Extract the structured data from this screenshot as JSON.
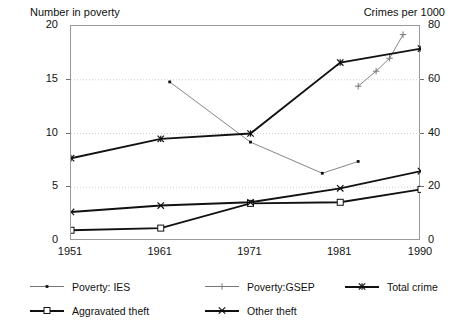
{
  "chart_data": {
    "type": "line",
    "title": "",
    "xlabel": "",
    "ylabel": "Number in poverty",
    "y2label": "Crimes per 1000",
    "x": [
      1951,
      1961,
      1971,
      1981,
      1990
    ],
    "xlim": [
      1951,
      1990
    ],
    "xticks": [
      "1951",
      "1961",
      "1971",
      "1981",
      "1990"
    ],
    "ylim": [
      0,
      20
    ],
    "yticks": [
      "0",
      "5",
      "10",
      "15",
      "20"
    ],
    "y2lim": [
      0,
      80
    ],
    "y2ticks": [
      "0",
      "20",
      "40",
      "60",
      "80"
    ],
    "grid": true,
    "legend_position": "below",
    "series": [
      {
        "name": "Poverty: IES",
        "axis": "left",
        "marker": "dot",
        "points": [
          [
            1962,
            14.8
          ],
          [
            1971,
            9.2
          ],
          [
            1979,
            6.3
          ],
          [
            1983,
            7.4
          ]
        ]
      },
      {
        "name": "Poverty:GSEP",
        "axis": "left",
        "marker": "plus",
        "points": [
          [
            1983,
            14.4
          ],
          [
            1985,
            15.8
          ],
          [
            1986.5,
            17.0
          ],
          [
            1988,
            19.2
          ]
        ]
      },
      {
        "name": "Total crime",
        "axis": "left",
        "marker": "asterisk",
        "points": [
          [
            1951,
            7.7
          ],
          [
            1961,
            9.5
          ],
          [
            1971,
            10.0
          ],
          [
            1981,
            16.6
          ],
          [
            1990,
            17.9
          ]
        ]
      },
      {
        "name": "Aggravated theft",
        "axis": "left",
        "marker": "square",
        "points": [
          [
            1951,
            1.0
          ],
          [
            1961,
            1.2
          ],
          [
            1971,
            3.5
          ],
          [
            1981,
            3.6
          ],
          [
            1990,
            4.8
          ]
        ]
      },
      {
        "name": "Other theft",
        "axis": "left",
        "marker": "cross",
        "points": [
          [
            1951,
            2.7
          ],
          [
            1961,
            3.3
          ],
          [
            1971,
            3.6
          ],
          [
            1981,
            4.9
          ],
          [
            1990,
            6.5
          ]
        ]
      }
    ]
  },
  "legend": {
    "items": [
      {
        "label": "Poverty: IES",
        "marker": "dot",
        "style": "thin"
      },
      {
        "label": "Poverty:GSEP",
        "marker": "plus",
        "style": "thin"
      },
      {
        "label": "Total crime",
        "marker": "asterisk",
        "style": "thick"
      },
      {
        "label": "Aggravated theft",
        "marker": "square",
        "style": "thick"
      },
      {
        "label": "Other theft",
        "marker": "cross",
        "style": "thick"
      }
    ]
  },
  "colors": {
    "axis": "#9a9a9a",
    "grid": "#cfcfcf",
    "ink": "#111111",
    "faint": "#777777"
  }
}
